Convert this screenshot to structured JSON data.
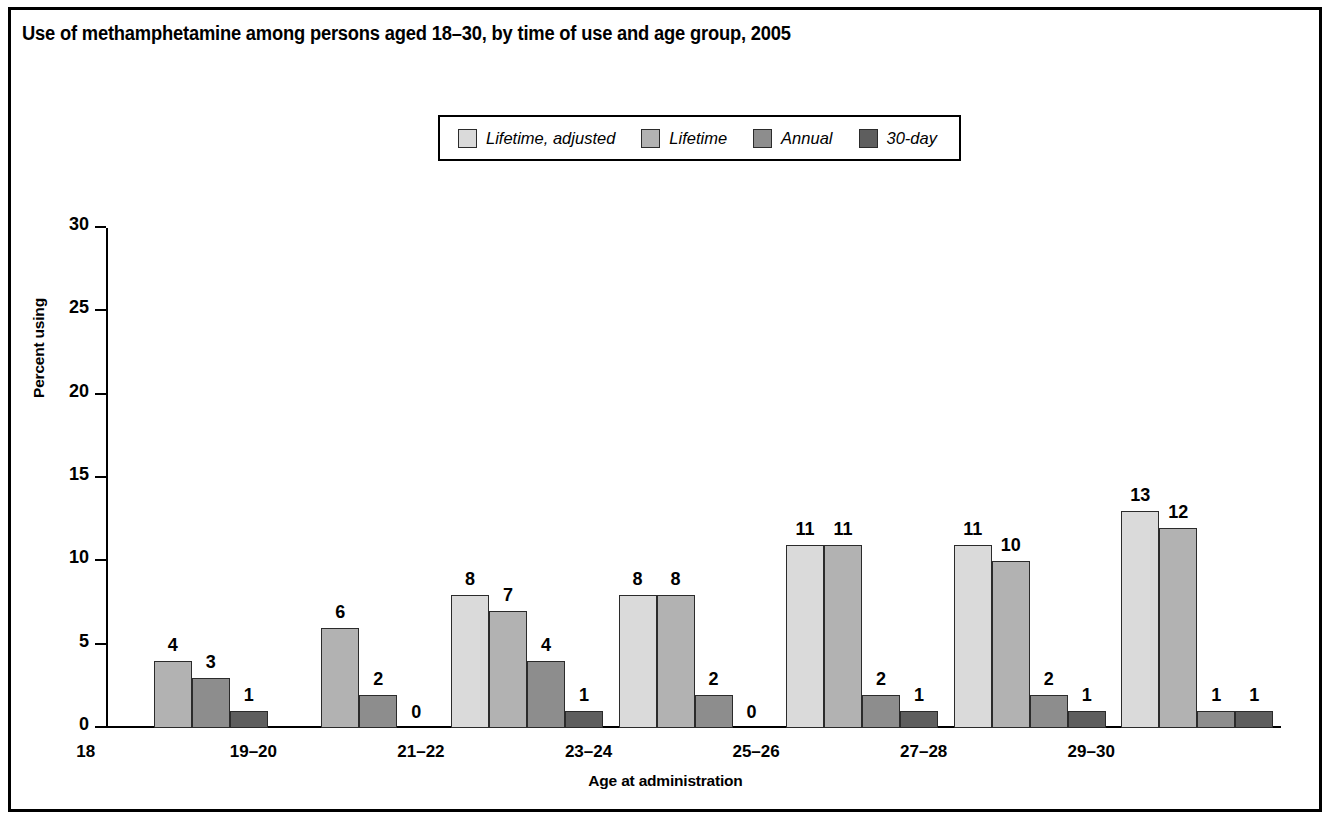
{
  "figure": {
    "title": "Use of methamphetamine among persons aged 18–30, by time of use and age group, 2005"
  },
  "legend": {
    "items": [
      {
        "label": "Lifetime, adjusted",
        "color": "#dadada",
        "swatch_name": "legend-swatch-lifetime-adjusted"
      },
      {
        "label": "Lifetime",
        "color": "#b2b2b2",
        "swatch_name": "legend-swatch-lifetime"
      },
      {
        "label": "Annual",
        "color": "#8d8d8d",
        "swatch_name": "legend-swatch-annual"
      },
      {
        "label": "30-day",
        "color": "#5e5e5e",
        "swatch_name": "legend-swatch-30-day"
      }
    ]
  },
  "chart_data": {
    "type": "bar",
    "title": "Use of methamphetamine among persons aged 18–30, by time of use and age group, 2005",
    "xlabel": "Age at administration",
    "ylabel": "Percent using",
    "ylim": [
      0,
      30
    ],
    "yticks": [
      0,
      5,
      10,
      15,
      20,
      25,
      30
    ],
    "ytick_labels": [
      "0",
      "5",
      "10",
      "15",
      "20",
      "25",
      "30"
    ],
    "grid": false,
    "legend_position": "top-center",
    "categories": [
      "18",
      "19–20",
      "21–22",
      "23–24",
      "25–26",
      "27–28",
      "29–30"
    ],
    "series": [
      {
        "name": "Lifetime, adjusted",
        "color": "#dadada",
        "values": [
          null,
          null,
          8,
          8,
          11,
          11,
          13
        ],
        "labels": [
          "",
          "",
          "8",
          "8",
          "11",
          "11",
          "13"
        ]
      },
      {
        "name": "Lifetime",
        "color": "#b2b2b2",
        "values": [
          4,
          6,
          7,
          8,
          11,
          10,
          12
        ],
        "labels": [
          "4",
          "6",
          "7",
          "8",
          "11",
          "10",
          "12"
        ]
      },
      {
        "name": "Annual",
        "color": "#8d8d8d",
        "values": [
          3,
          2,
          4,
          2,
          2,
          2,
          1
        ],
        "labels": [
          "3",
          "2",
          "4",
          "2",
          "2",
          "2",
          "1"
        ]
      },
      {
        "name": "30-day",
        "color": "#5e5e5e",
        "values": [
          1,
          0,
          1,
          0,
          1,
          1,
          1
        ],
        "labels": [
          "1",
          "0",
          "1",
          "0",
          "1",
          "1",
          "1"
        ]
      }
    ]
  }
}
